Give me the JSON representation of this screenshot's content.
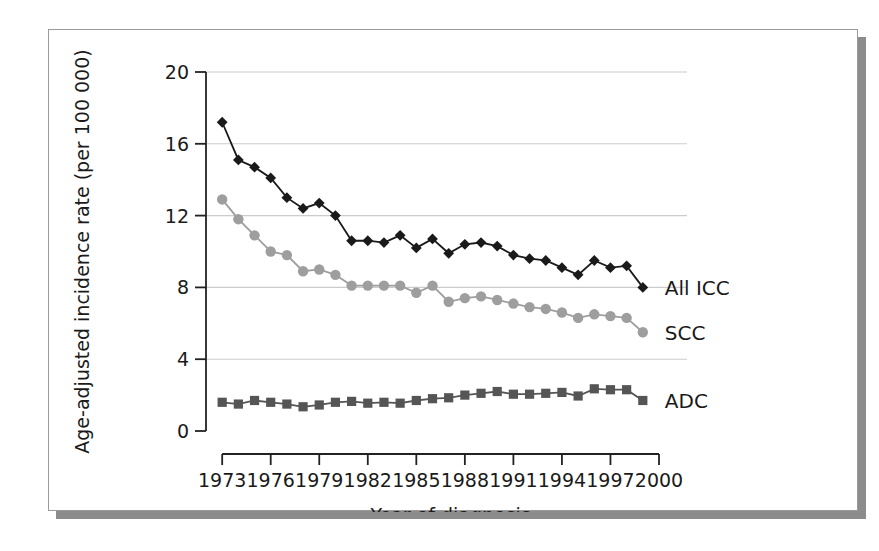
{
  "figure": {
    "background": "#ffffff",
    "frame_border_color": "#9a9a9a",
    "shadow_color": "#8c8c8c"
  },
  "chart_data": {
    "type": "line",
    "title": "",
    "xlabel": "Year of diagnosis",
    "ylabel": "Age-adjusted incidence rate (per 100 000)",
    "xlim": [
      1972,
      2000
    ],
    "ylim": [
      0,
      20
    ],
    "xticks": [
      1973,
      1976,
      1979,
      1982,
      1985,
      1988,
      1991,
      1994,
      1997,
      2000
    ],
    "yticks": [
      0,
      4,
      8,
      12,
      16,
      20
    ],
    "xtick_labels": [
      "1973",
      "1976",
      "1979",
      "1982",
      "1985",
      "1988",
      "1991",
      "1994",
      "1997",
      "2000"
    ],
    "ytick_labels": [
      "0",
      "4",
      "8",
      "12",
      "16",
      "20"
    ],
    "grid": "horizontal",
    "grid_color": "#cccccc",
    "legend_position": "right-inline",
    "x": [
      1973,
      1974,
      1975,
      1976,
      1977,
      1978,
      1979,
      1980,
      1981,
      1982,
      1983,
      1984,
      1985,
      1986,
      1987,
      1988,
      1989,
      1990,
      1991,
      1992,
      1993,
      1994,
      1995,
      1996,
      1997,
      1998,
      1999
    ],
    "series": [
      {
        "name": "All ICC",
        "label": "All ICC",
        "color": "#1a1a1a",
        "marker": "diamond",
        "values": [
          17.2,
          15.1,
          14.7,
          14.1,
          13.0,
          12.4,
          12.7,
          12.0,
          10.6,
          10.6,
          10.5,
          10.9,
          10.2,
          10.7,
          9.9,
          10.4,
          10.5,
          10.3,
          9.8,
          9.6,
          9.5,
          9.1,
          8.7,
          9.5,
          9.1,
          9.2,
          8.0
        ]
      },
      {
        "name": "SCC",
        "label": "SCC",
        "color": "#9e9e9e",
        "marker": "circle",
        "values": [
          12.9,
          11.8,
          10.9,
          10.0,
          9.8,
          8.9,
          9.0,
          8.7,
          8.1,
          8.1,
          8.1,
          8.1,
          7.7,
          8.1,
          7.2,
          7.4,
          7.5,
          7.3,
          7.1,
          6.9,
          6.8,
          6.6,
          6.3,
          6.5,
          6.4,
          6.3,
          5.5
        ]
      },
      {
        "name": "ADC",
        "label": "ADC",
        "color": "#555555",
        "marker": "square",
        "values": [
          1.6,
          1.5,
          1.7,
          1.6,
          1.5,
          1.35,
          1.45,
          1.6,
          1.65,
          1.55,
          1.6,
          1.55,
          1.7,
          1.8,
          1.85,
          2.0,
          2.1,
          2.2,
          2.05,
          2.05,
          2.1,
          2.15,
          1.95,
          2.35,
          2.3,
          2.3,
          1.7
        ]
      }
    ]
  }
}
